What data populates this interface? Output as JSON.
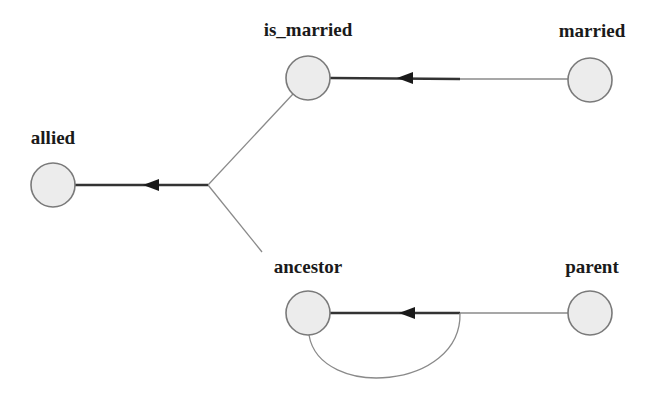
{
  "diagram": {
    "type": "dependency-graph",
    "nodes": [
      {
        "id": "is_married",
        "label": "is_married",
        "x": 308,
        "y": 78
      },
      {
        "id": "married",
        "label": "married",
        "x": 590,
        "y": 80
      },
      {
        "id": "allied",
        "label": "allied",
        "x": 53,
        "y": 185
      },
      {
        "id": "ancestor",
        "label": "ancestor",
        "x": 308,
        "y": 313
      },
      {
        "id": "parent",
        "label": "parent",
        "x": 590,
        "y": 313
      }
    ],
    "edges": [
      {
        "from": "married",
        "to": "is_married"
      },
      {
        "from": "is_married",
        "to": "allied",
        "via": "junction"
      },
      {
        "from": "ancestor",
        "to": "allied",
        "via": "junction"
      },
      {
        "from": "parent",
        "to": "ancestor"
      },
      {
        "from": "ancestor",
        "to": "ancestor",
        "type": "self-loop"
      }
    ],
    "colors": {
      "node_fill": "#ececec",
      "node_stroke": "#7a7a7a",
      "edge_thin": "#8a8a8a",
      "edge_thick": "#333333",
      "text": "#1a1a1a"
    }
  }
}
